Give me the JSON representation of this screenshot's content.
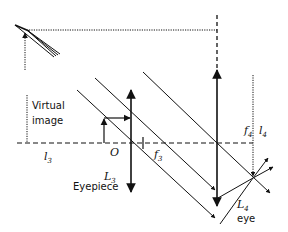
{
  "diagram": {
    "colors": {
      "stroke": "#111111",
      "background": "#ffffff"
    },
    "labels": {
      "virtual_image_line1": "Virtual",
      "virtual_image_line2": "image",
      "l3_main": "l",
      "l3_sub": "3",
      "origin": "O",
      "f3_main": "f",
      "f3_sub": "3",
      "L3_main": "L",
      "L3_sub": "3",
      "eyepiece": "Eyepiece",
      "f4_main": "f",
      "f4_sub": "4",
      "l4_main": "l",
      "l4_sub": "4",
      "L4_main": "L",
      "L4_sub": "4",
      "eye": "eye"
    },
    "elements": [
      {
        "name": "optical-axis",
        "type": "dashed-line"
      },
      {
        "name": "eyepiece-lens-L3",
        "type": "double-arrow"
      },
      {
        "name": "eye-lens-L4",
        "type": "double-arrow"
      },
      {
        "name": "object-arrow",
        "type": "arrow"
      },
      {
        "name": "parallel-rays",
        "type": "lines",
        "count": 4
      },
      {
        "name": "virtual-image-marker",
        "type": "dotted-line"
      },
      {
        "name": "top-left-image",
        "type": "ray-bundle"
      }
    ]
  }
}
